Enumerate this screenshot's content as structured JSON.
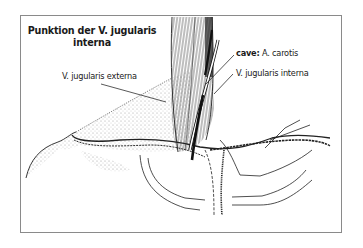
{
  "figure": {
    "title_line1": "Punktion der V. jugularis",
    "title_line2": "interna"
  },
  "labels": {
    "carotis_prefix": "cave:",
    "carotis_name": " A. carotis",
    "jugularis_interna": "V. jugularis interna",
    "jugularis_externa": "V. jugularis externa"
  },
  "colors": {
    "ink": "#1a1a1a",
    "frame": "#8a8a8a",
    "background": "#ffffff"
  }
}
